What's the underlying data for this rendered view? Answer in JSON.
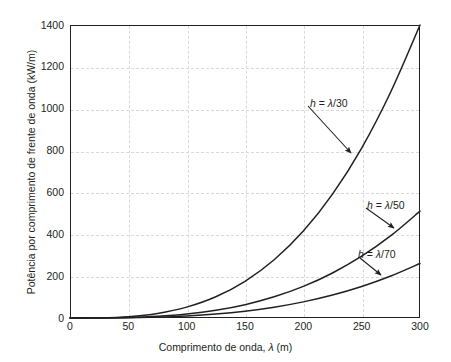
{
  "chart_data": {
    "type": "line",
    "title": "",
    "xlabel": "Comprimento de onda, λ (m)",
    "ylabel": "Potência por comprimento de frente de onda (kW/m)",
    "xlim": [
      0,
      300
    ],
    "ylim": [
      0,
      1400
    ],
    "xticks": [
      0,
      50,
      100,
      150,
      200,
      250,
      300
    ],
    "yticks": [
      0,
      200,
      400,
      600,
      800,
      1000,
      1200,
      1400
    ],
    "xtick_labels": [
      "0",
      "50",
      "100",
      "150",
      "200",
      "250",
      "300"
    ],
    "ytick_labels": [
      "0",
      "200",
      "400",
      "600",
      "800",
      "1000",
      "1200",
      "1400"
    ],
    "grid": true,
    "grid_style": "dashed",
    "grid_color": "#d9d9d9",
    "legend_position": "none",
    "line_color": "#231f20",
    "x": [
      0,
      25,
      50,
      75,
      100,
      125,
      150,
      175,
      200,
      225,
      250,
      275,
      300
    ],
    "series": [
      {
        "name": "h = λ/30",
        "label": "h = λ/30",
        "values": [
          0,
          0.81,
          6.5,
          21.9,
          51.9,
          101.3,
          175.1,
          278.1,
          415.3,
          591.6,
          811.9,
          1081.2,
          1404.0
        ]
      },
      {
        "name": "h = λ/50",
        "label": "h = λ/50",
        "values": [
          0,
          0.29,
          2.36,
          7.96,
          18.87,
          36.85,
          63.68,
          101.14,
          151.0,
          215.1,
          295.2,
          393.2,
          510.5
        ]
      },
      {
        "name": "h = λ/70",
        "label": "h = λ/70",
        "values": [
          0,
          0.15,
          1.21,
          4.06,
          9.63,
          18.8,
          32.49,
          51.6,
          77.04,
          109.7,
          150.6,
          200.6,
          260.4
        ]
      }
    ],
    "annotations": [
      {
        "text": "h = λ/30",
        "label_x": 310,
        "label_y": 97,
        "arrow_from": [
          308,
          106
        ],
        "arrow_to": [
          351,
          153
        ]
      },
      {
        "text": "h = λ/50",
        "label_x": 367,
        "label_y": 199,
        "arrow_from": [
          366,
          208
        ],
        "arrow_to": [
          394,
          228
        ]
      },
      {
        "text": "h = λ/70",
        "label_x": 358,
        "label_y": 248,
        "arrow_from": [
          360,
          258
        ],
        "arrow_to": [
          381,
          275
        ]
      }
    ]
  }
}
